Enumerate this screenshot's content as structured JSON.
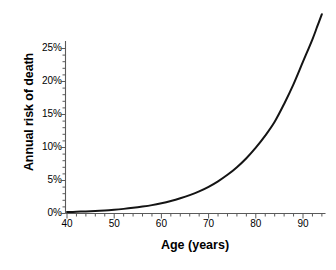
{
  "chart_data": {
    "type": "line",
    "title": "",
    "xlabel": "Age (years)",
    "ylabel": "Annual risk of death",
    "xlim": [
      40,
      95
    ],
    "ylim": [
      0,
      30
    ],
    "grid": false,
    "legend": null,
    "xticks": [
      40,
      50,
      60,
      70,
      80,
      90
    ],
    "xtick_labels": [
      "40",
      "50",
      "60",
      "70",
      "80",
      "90"
    ],
    "yticks": [
      0,
      5,
      10,
      15,
      20,
      25
    ],
    "ytick_labels": [
      "0%",
      "5%",
      "10%",
      "15%",
      "20%",
      "25%"
    ],
    "x_minor_tick_step": 2,
    "y_minor_tick_step": 1,
    "series": [
      {
        "name": "Annual risk of death",
        "color": "#141414",
        "line_width": 2,
        "x": [
          40,
          42,
          44,
          46,
          48,
          50,
          52,
          54,
          56,
          58,
          60,
          62,
          64,
          66,
          68,
          70,
          72,
          74,
          76,
          78,
          80,
          82,
          84,
          86,
          88,
          90,
          92,
          93,
          94
        ],
        "y": [
          0.22,
          0.26,
          0.32,
          0.39,
          0.47,
          0.57,
          0.7,
          0.86,
          1.05,
          1.27,
          1.55,
          1.89,
          2.3,
          2.78,
          3.36,
          4.05,
          4.88,
          5.86,
          7.02,
          8.38,
          9.98,
          11.8,
          13.9,
          16.6,
          19.6,
          23.0,
          26.4,
          28.3,
          30.2
        ]
      }
    ],
    "annotations": []
  },
  "axis": {
    "y_title": "Annual risk of death",
    "x_title": "Age (years)"
  }
}
